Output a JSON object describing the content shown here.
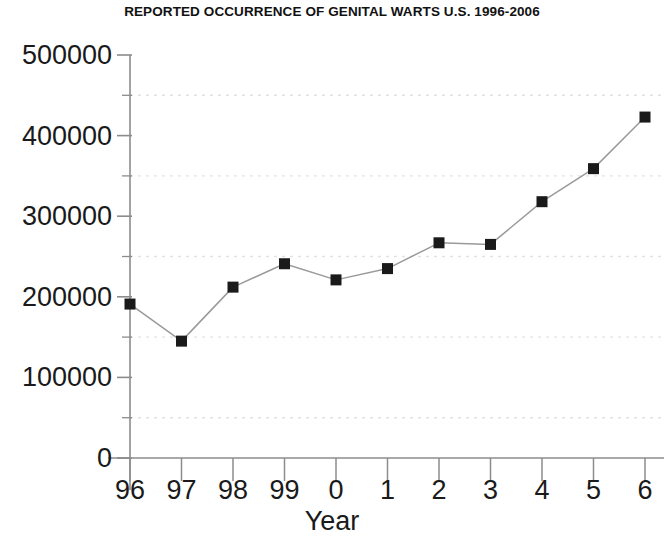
{
  "chart_data": {
    "type": "line",
    "title": "REPORTED OCCURRENCE OF GENITAL WARTS U.S. 1996-2006",
    "xlabel": "Year",
    "ylabel": "",
    "categories": [
      "96",
      "97",
      "98",
      "99",
      "0",
      "1",
      "2",
      "3",
      "4",
      "5",
      "6"
    ],
    "x_values": [
      1996,
      1997,
      1998,
      1999,
      2000,
      2001,
      2002,
      2003,
      2004,
      2005,
      2006
    ],
    "values": [
      191000,
      145000,
      212000,
      241000,
      221000,
      235000,
      267000,
      265000,
      318000,
      359000,
      423000
    ],
    "ylim": [
      0,
      500000
    ],
    "ytick_labels": [
      "0",
      "100000",
      "200000",
      "300000",
      "400000",
      "500000"
    ],
    "ytick_values": [
      0,
      100000,
      200000,
      300000,
      400000,
      500000
    ],
    "minor_gridlines": [
      50000,
      150000,
      250000,
      350000,
      450000
    ],
    "grid": "horizontal-dotted-at-minor-ticks",
    "legend": "none",
    "marker": "filled-square",
    "series": [
      {
        "name": "Reported occurrence of genital warts",
        "values": [
          191000,
          145000,
          212000,
          241000,
          221000,
          235000,
          267000,
          265000,
          318000,
          359000,
          423000
        ]
      }
    ],
    "colors": {
      "background": "#ffffff",
      "line": "#9a9a9a",
      "marker": "#1a1a1a",
      "axis": "#8c8c8c",
      "grid": "#e2e2e2",
      "text": "#1a1a1a"
    }
  }
}
